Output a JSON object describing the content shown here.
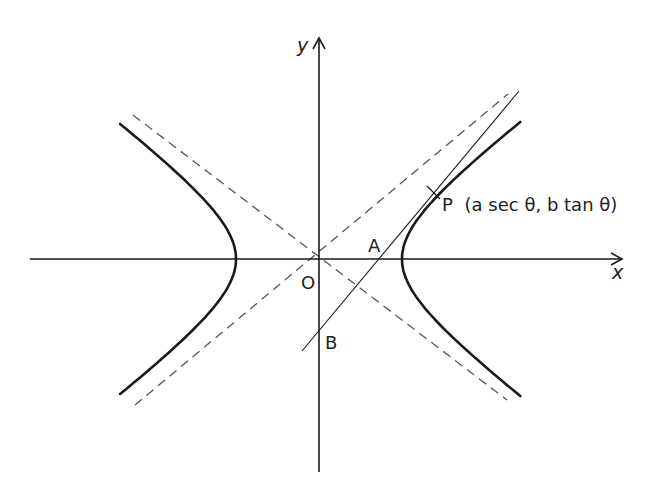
{
  "figure": {
    "colors": {
      "ink": "#1a1a1a",
      "dash": "#555555",
      "background": "#ffffff"
    }
  },
  "labels": {
    "y_axis": "y",
    "x_axis": "x",
    "origin": "O",
    "point_a": "A",
    "point_b": "B",
    "point_p_name": "P",
    "point_p_coords": "(a sec θ, b tan θ)"
  },
  "geometry": {
    "origin": [
      319,
      259
    ],
    "a": 83,
    "b": 62,
    "x_axis_range": [
      30,
      622
    ],
    "y_axis_range": [
      38,
      472
    ],
    "vertex_left": [
      236,
      259
    ],
    "vertex_right": [
      401,
      259
    ],
    "point_p": [
      434,
      193
    ],
    "point_a": [
      377,
      259
    ],
    "point_b": [
      319,
      330
    ],
    "tangent_endpoints": [
      [
        302,
        351
      ],
      [
        519,
        91
      ]
    ],
    "asymptote_1": [
      [
        133,
        115
      ],
      [
        507,
        400
      ]
    ],
    "asymptote_2": [
      [
        135,
        405
      ],
      [
        508,
        94
      ]
    ]
  }
}
